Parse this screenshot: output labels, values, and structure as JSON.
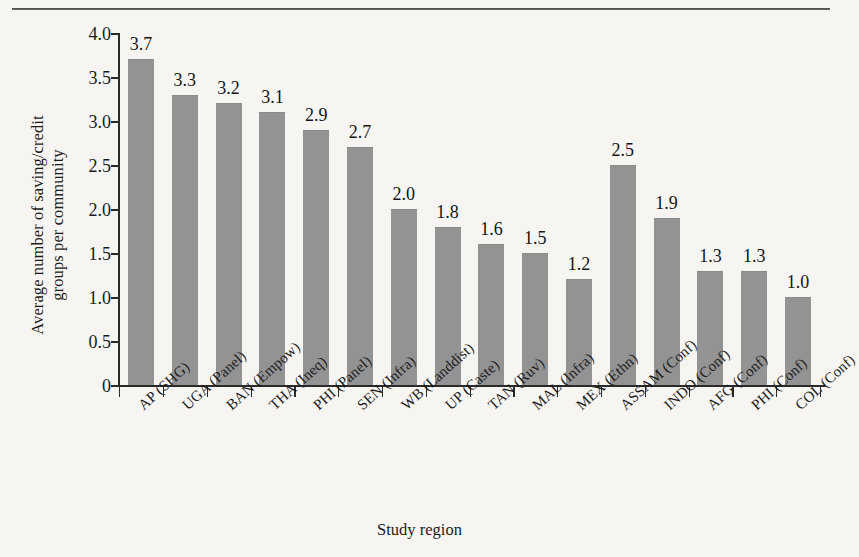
{
  "figure": {
    "background_color": "#f6f5f2",
    "bar_color": "#939393",
    "axis_color": "#2a2a2a",
    "rule_color": "#4a4a4a"
  },
  "chart_data": {
    "type": "bar",
    "title": "",
    "xlabel": "Study region",
    "ylabel": "Average number of saving/credit groups per community",
    "ylabel_line1": "Average number of saving/credit",
    "ylabel_line2": "groups per community",
    "ylim": [
      0,
      4.0
    ],
    "yticks": [
      0,
      0.5,
      1.0,
      1.5,
      2.0,
      2.5,
      3.0,
      3.5,
      4.0
    ],
    "ytick_labels": [
      "0",
      "0.5",
      "1.0",
      "1.5",
      "2.0",
      "2.5",
      "3.0",
      "3.5",
      "4.0"
    ],
    "grid": false,
    "legend": null,
    "data_labels": true,
    "categories": [
      "AP (SHG)",
      "UGA (Panel)",
      "BAN (Empow)",
      "THA (Ineq)",
      "PHI (Panel)",
      "SEN (Infra)",
      "WB (Landdist)",
      "UP (Caste)",
      "TAN (Ruv)",
      "MAL (Infra)",
      "MEX (Ethn)",
      "ASSAM (Conf)",
      "INDO (Conf)",
      "AFG (Conf)",
      "PHI (Conf)",
      "COL (Conf)"
    ],
    "values": [
      3.7,
      3.3,
      3.2,
      3.1,
      2.9,
      2.7,
      2.0,
      1.8,
      1.6,
      1.5,
      1.2,
      2.5,
      1.9,
      1.3,
      1.3,
      1.0
    ],
    "value_labels": [
      "3.7",
      "3.3",
      "3.2",
      "3.1",
      "2.9",
      "2.7",
      "2.0",
      "1.8",
      "1.6",
      "1.5",
      "1.2",
      "2.5",
      "1.9",
      "1.3",
      "1.3",
      "1.0"
    ]
  }
}
